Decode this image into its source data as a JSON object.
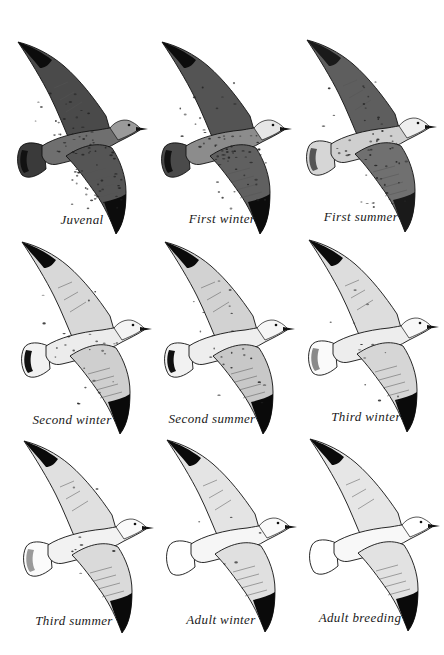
{
  "plate": {
    "background": "#ffffff",
    "ink": "#111111"
  },
  "birds": [
    {
      "caption": "Juvenal",
      "row": 0,
      "col": 0,
      "x": 14,
      "y": 38,
      "capX": 82,
      "capY": 212,
      "body": "#6f6f6f",
      "upper": "#4a4a4a",
      "lower": "#555555",
      "tip": "#0c0c0c",
      "tail": "#3a3a3a",
      "tailBand": "#111111",
      "head": "#9a9a9a",
      "mottle": 0.9
    },
    {
      "caption": "First winter",
      "row": 0,
      "col": 1,
      "x": 158,
      "y": 38,
      "capX": 222,
      "capY": 211,
      "body": "#8c8c8c",
      "upper": "#545454",
      "lower": "#606060",
      "tip": "#0c0c0c",
      "tail": "#4a4a4a",
      "tailBand": "#111111",
      "head": "#e6e6e6",
      "mottle": 0.8
    },
    {
      "caption": "First summer",
      "row": 0,
      "col": 2,
      "x": 303,
      "y": 36,
      "capX": 361,
      "capY": 209,
      "body": "#cfcfcf",
      "upper": "#5e5e5e",
      "lower": "#707070",
      "tip": "#1a1a1a",
      "tail": "#d6d6d6",
      "tailBand": "#555555",
      "head": "#efefef",
      "mottle": 0.6
    },
    {
      "caption": "Second winter",
      "row": 1,
      "col": 0,
      "x": 18,
      "y": 238,
      "capX": 72,
      "capY": 412,
      "body": "#ececec",
      "upper": "#d8d8d8",
      "lower": "#cfcfcf",
      "tip": "#0a0a0a",
      "tail": "#f2f2f2",
      "tailBand": "#111111",
      "head": "#f4f4f4",
      "mottle": 0.3
    },
    {
      "caption": "Second summer",
      "row": 1,
      "col": 1,
      "x": 161,
      "y": 238,
      "capX": 212,
      "capY": 411,
      "body": "#eeeeee",
      "upper": "#d2d2d2",
      "lower": "#c8c8c8",
      "tip": "#0a0a0a",
      "tail": "#f2f2f2",
      "tailBand": "#111111",
      "head": "#f6f6f6",
      "mottle": 0.3
    },
    {
      "caption": "Third winter",
      "row": 1,
      "col": 2,
      "x": 305,
      "y": 236,
      "capX": 366,
      "capY": 409,
      "body": "#ededed",
      "upper": "#dddddd",
      "lower": "#d6d6d6",
      "tip": "#0a0a0a",
      "tail": "#fafafa",
      "tailBand": "#8a8a8a",
      "head": "#f8f8f8",
      "mottle": 0.15
    },
    {
      "caption": "Third summer",
      "row": 2,
      "col": 0,
      "x": 20,
      "y": 437,
      "capX": 74,
      "capY": 613,
      "body": "#f2f2f2",
      "upper": "#e0e0e0",
      "lower": "#dadada",
      "tip": "#0a0a0a",
      "tail": "#fbfbfb",
      "tailBand": "#9a9a9a",
      "head": "#fafafa",
      "mottle": 0.1
    },
    {
      "caption": "Adult winter",
      "row": 2,
      "col": 1,
      "x": 163,
      "y": 436,
      "capX": 221,
      "capY": 612,
      "body": "#f6f6f6",
      "upper": "#e4e4e4",
      "lower": "#e0e0e0",
      "tip": "#0a0a0a",
      "tail": "#ffffff",
      "tailBand": "#ffffff",
      "head": "#fafafa",
      "mottle": 0.05
    },
    {
      "caption": "Adult breeding",
      "row": 2,
      "col": 2,
      "x": 306,
      "y": 435,
      "capX": 360,
      "capY": 610,
      "body": "#f8f8f8",
      "upper": "#e6e6e6",
      "lower": "#e2e2e2",
      "tip": "#0a0a0a",
      "tail": "#ffffff",
      "tailBand": "#ffffff",
      "head": "#ffffff",
      "mottle": 0.0
    }
  ]
}
